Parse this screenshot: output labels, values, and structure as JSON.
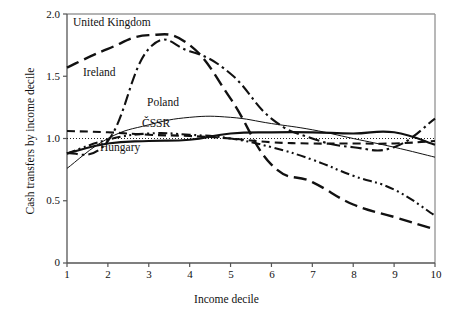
{
  "chart_data": {
    "type": "line",
    "title": "",
    "xlabel": "Income decile",
    "ylabel": "Cash transfers by income decile",
    "x": [
      1,
      2,
      3,
      4,
      5,
      6,
      7,
      8,
      9,
      10
    ],
    "xlim": [
      1,
      10
    ],
    "ylim": [
      0,
      2.0
    ],
    "y_ticks": [
      "0",
      "0.5",
      "1.0",
      "1.5",
      "2.0"
    ],
    "y_tick_values": [
      0,
      0.5,
      1.0,
      1.5,
      2.0
    ],
    "x_ticks": [
      "1",
      "2",
      "3",
      "4",
      "5",
      "6",
      "7",
      "8",
      "9",
      "10"
    ],
    "grid": false,
    "reference_line": {
      "value": 1.0,
      "style": "dotted"
    },
    "legend_position": "inline-labels",
    "series": [
      {
        "name": "United Kingdom",
        "style": "long-dash",
        "label_x": 2.05,
        "label_y": 1.91,
        "values": [
          1.57,
          1.72,
          1.83,
          1.75,
          1.32,
          0.79,
          0.65,
          0.47,
          0.37,
          0.27
        ]
      },
      {
        "name": "Ireland",
        "style": "dash-dot",
        "label_x": 1.75,
        "label_y": 1.5,
        "values": [
          0.88,
          0.98,
          1.72,
          1.7,
          1.52,
          1.16,
          1.0,
          0.93,
          0.93,
          1.16
        ]
      },
      {
        "name": "Poland",
        "style": "thin-solid",
        "label_x": 4.0,
        "label_y": 1.25,
        "values": [
          0.76,
          1.0,
          1.11,
          1.17,
          1.17,
          1.12,
          1.07,
          1.0,
          0.93,
          0.85
        ]
      },
      {
        "name": "ČSSR",
        "style": "medium-dash",
        "label_x": 3.9,
        "label_y": 1.12,
        "values": [
          1.06,
          1.05,
          1.03,
          1.02,
          1.0,
          0.97,
          0.96,
          0.96,
          0.96,
          0.98
        ]
      },
      {
        "name": "Hungary",
        "style": "thick-solid",
        "label_x": 2.65,
        "label_y": 0.93,
        "values": [
          0.88,
          0.96,
          0.98,
          0.99,
          1.04,
          1.05,
          1.05,
          1.04,
          1.05,
          0.95
        ]
      },
      {
        "name": "Hungary-secondary",
        "style": "dash-dot-dot",
        "label_x": null,
        "label_y": null,
        "values": [
          0.88,
          0.99,
          1.04,
          1.03,
          1.0,
          0.93,
          0.83,
          0.7,
          0.59,
          0.38
        ]
      }
    ]
  },
  "labels": {
    "united_kingdom": "United Kingdom",
    "ireland": "Ireland",
    "poland": "Poland",
    "cssr": "ČSSR",
    "hungary": "Hungary",
    "x_axis": "Income decile",
    "y_axis": "Cash transfers by income decile"
  },
  "ticks": {
    "y": [
      "2.0",
      "1.5",
      "1.0",
      "0.5",
      "0"
    ],
    "x": [
      "1",
      "2",
      "3",
      "4",
      "5",
      "6",
      "7",
      "8",
      "9",
      "10"
    ]
  },
  "colors": {
    "line": "#111111",
    "axis": "#555555",
    "background": "#ffffff"
  }
}
